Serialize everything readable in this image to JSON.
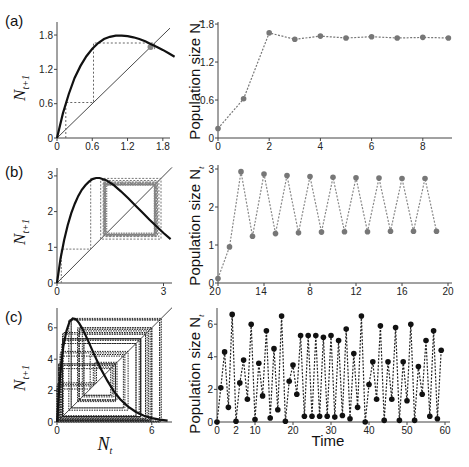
{
  "figure": {
    "panels": [
      {
        "label": "(a)"
      },
      {
        "label": "(b)"
      },
      {
        "label": "(c)"
      }
    ],
    "left_ylabel_main": "N",
    "left_ylabel_sub": "t+1",
    "left_xlabel_main": "N",
    "left_xlabel_sub": "t",
    "right_ylabel": "Population size N",
    "right_ylabel_sub": "t",
    "bottom_xlabel": "Time"
  },
  "chart_data": [
    {
      "panel": "(a) left",
      "type": "line",
      "title": "",
      "xlabel": "",
      "ylabel": "N_t+1",
      "xlim": [
        0,
        2.0
      ],
      "ylim": [
        0,
        1.95
      ],
      "xticks": [
        "0",
        "0.6",
        "1.2",
        "1.8"
      ],
      "yticks": [
        "0",
        "0.6",
        "1.2",
        "1.8"
      ],
      "description": "Map curve with cobweb iteration converging to equilibrium ~1.6",
      "series": [
        {
          "name": "map",
          "x": [
            0,
            0.1,
            0.2,
            0.3,
            0.4,
            0.5,
            0.6,
            0.7,
            0.8,
            0.9,
            1.0,
            1.1,
            1.2,
            1.3,
            1.4,
            1.5,
            1.6,
            1.7,
            1.8,
            1.9,
            2.0
          ],
          "y": [
            0,
            0.43,
            0.77,
            1.05,
            1.26,
            1.43,
            1.56,
            1.66,
            1.73,
            1.77,
            1.79,
            1.79,
            1.78,
            1.76,
            1.73,
            1.69,
            1.64,
            1.59,
            1.54,
            1.48,
            1.42
          ]
        },
        {
          "name": "identity",
          "x": [
            0,
            2.0
          ],
          "y": [
            0,
            2.0
          ]
        },
        {
          "name": "cobweb",
          "x": [
            0.15,
            0.15,
            0.62,
            0.62,
            1.66,
            1.66,
            1.56,
            1.56,
            1.61
          ],
          "y": [
            0,
            0.62,
            0.62,
            1.66,
            1.66,
            1.56,
            1.56,
            1.61,
            1.61
          ]
        }
      ]
    },
    {
      "panel": "(a) right",
      "type": "line",
      "xlabel": "",
      "ylabel": "Population size N_t",
      "xlim": [
        0,
        9
      ],
      "ylim": [
        0,
        1.8
      ],
      "xticks": [
        "0",
        "2",
        "4",
        "6",
        "8"
      ],
      "yticks": [
        "0",
        "0.6",
        "1.2",
        "1.8"
      ],
      "x": [
        0,
        1,
        2,
        3,
        4,
        5,
        6,
        7,
        8,
        9
      ],
      "values": [
        0.15,
        0.62,
        1.66,
        1.56,
        1.61,
        1.58,
        1.6,
        1.58,
        1.59,
        1.58
      ]
    },
    {
      "panel": "(b) left",
      "type": "line",
      "ylabel": "N_t+1",
      "xlim": [
        0,
        3.3
      ],
      "ylim": [
        0,
        3.1
      ],
      "xticks": [
        "0",
        "3"
      ],
      "yticks": [
        "0",
        "1",
        "2",
        "3"
      ],
      "description": "Map curve with cobweb iteration converging to 2-cycle (~1.35, ~2.76)",
      "series": [
        {
          "name": "map",
          "x": [
            0,
            0.1,
            0.2,
            0.3,
            0.4,
            0.5,
            0.6,
            0.7,
            0.8,
            0.9,
            1.0,
            1.1,
            1.2,
            1.4,
            1.6,
            1.8,
            2.0,
            2.2,
            2.4,
            2.6,
            2.8,
            3.0,
            3.2
          ],
          "y": [
            0,
            0.68,
            1.2,
            1.62,
            1.95,
            2.22,
            2.44,
            2.61,
            2.74,
            2.84,
            2.91,
            2.94,
            2.94,
            2.87,
            2.74,
            2.57,
            2.38,
            2.18,
            1.98,
            1.78,
            1.59,
            1.4,
            1.23
          ]
        },
        {
          "name": "identity",
          "x": [
            0,
            3.3
          ],
          "y": [
            0,
            3.3
          ]
        }
      ]
    },
    {
      "panel": "(b) right",
      "type": "line",
      "ylabel": "Population size N_t",
      "xlim": [
        0,
        20
      ],
      "ylim": [
        0,
        3
      ],
      "xticks": [
        "0",
        "4",
        "8",
        "12",
        "16",
        "20"
      ],
      "xtick_overlay_labels": [
        "2",
        "1"
      ],
      "yticks": [
        "0",
        "1",
        "2",
        "3"
      ],
      "x": [
        0,
        1,
        2,
        3,
        4,
        5,
        6,
        7,
        8,
        9,
        10,
        11,
        12,
        13,
        14,
        15,
        16,
        17,
        18,
        19
      ],
      "values": [
        0.12,
        0.95,
        2.93,
        1.23,
        2.87,
        1.3,
        2.83,
        1.32,
        2.8,
        1.34,
        2.78,
        1.35,
        2.77,
        1.35,
        2.76,
        1.36,
        2.75,
        1.36,
        2.75,
        1.36
      ]
    },
    {
      "panel": "(c) left",
      "type": "line",
      "ylabel": "N_t+1",
      "xlabel": "N_t",
      "xlim": [
        0,
        7.0
      ],
      "ylim": [
        0,
        7.0
      ],
      "xticks": [
        "0",
        "6"
      ],
      "yticks": [
        "0",
        "2",
        "4",
        "6"
      ],
      "description": "Map curve with chaotic cobweb trajectory",
      "series": [
        {
          "name": "map",
          "x": [
            0,
            0.2,
            0.4,
            0.6,
            0.8,
            1.0,
            1.2,
            1.4,
            1.6,
            1.8,
            2.0,
            2.4,
            2.8,
            3.2,
            3.6,
            4.0,
            4.5,
            5.0,
            5.5,
            6.0,
            6.5,
            7.0
          ],
          "y": [
            0,
            3.0,
            4.8,
            5.8,
            6.4,
            6.6,
            6.55,
            6.3,
            5.95,
            5.55,
            5.1,
            4.2,
            3.35,
            2.6,
            1.95,
            1.45,
            0.98,
            0.64,
            0.4,
            0.25,
            0.15,
            0.09
          ]
        },
        {
          "name": "identity",
          "x": [
            0,
            7.0
          ],
          "y": [
            0,
            7.0
          ]
        }
      ]
    },
    {
      "panel": "(c) right",
      "type": "line",
      "xlabel": "Time",
      "ylabel": "Population size N_t",
      "xlim": [
        0,
        60
      ],
      "ylim": [
        0,
        6.8
      ],
      "xticks": [
        "0",
        "10",
        "20",
        "30",
        "40",
        "50",
        "60"
      ],
      "xtick_overlay_labels": [
        "2"
      ],
      "yticks": [
        "0",
        "2",
        "4",
        "6"
      ],
      "x": [
        0,
        1,
        2,
        3,
        4,
        5,
        6,
        7,
        8,
        9,
        10,
        11,
        12,
        13,
        14,
        15,
        16,
        17,
        18,
        19,
        20,
        21,
        22,
        23,
        24,
        25,
        26,
        27,
        28,
        29,
        30,
        31,
        32,
        33,
        34,
        35,
        36,
        37,
        38,
        39,
        40,
        41,
        42,
        43,
        44,
        45,
        46,
        47,
        48,
        49,
        50,
        51,
        52,
        53,
        54,
        55,
        56,
        57,
        58,
        59
      ],
      "values": [
        0.0,
        2.1,
        4.3,
        0.9,
        6.6,
        0.05,
        2.4,
        3.8,
        1.4,
        6.0,
        0.15,
        3.6,
        1.6,
        5.6,
        0.25,
        4.5,
        0.75,
        6.5,
        0.05,
        2.5,
        3.5,
        1.7,
        5.3,
        0.35,
        5.3,
        0.35,
        5.3,
        0.35,
        5.2,
        0.35,
        5.3,
        0.3,
        5.0,
        0.4,
        5.7,
        0.2,
        4.2,
        0.9,
        6.5,
        0.0,
        2.3,
        3.7,
        1.4,
        5.9,
        0.1,
        3.7,
        1.4,
        5.8,
        0.1,
        3.7,
        1.3,
        6.0,
        0.1,
        3.4,
        1.7,
        5.0,
        0.35,
        5.6,
        0.2,
        4.4
      ]
    }
  ]
}
